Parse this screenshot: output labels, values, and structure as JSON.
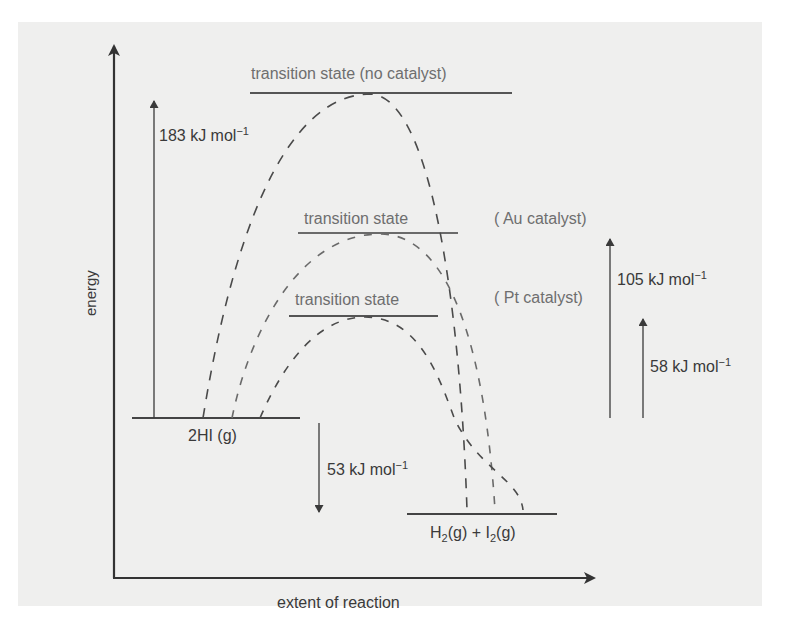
{
  "diagram": {
    "axes": {
      "y_label": "energy",
      "x_label": "extent of reaction"
    },
    "levels": {
      "reactant": {
        "label_main": "2HI",
        "label_state": " (g)"
      },
      "product": {
        "h2": "H",
        "h2_sub": "2",
        "h2_state": "(g) + I",
        "i2_sub": "2",
        "i2_state": "(g)"
      }
    },
    "transition_states": [
      {
        "label": "transition state (no catalyst)",
        "catalyst": "no catalyst"
      },
      {
        "label": "transition state",
        "catalyst_label": "( Au catalyst)"
      },
      {
        "label": "transition state",
        "catalyst_label": "( Pt catalyst)"
      }
    ],
    "energy_arrows": [
      {
        "value": "183 kJ mol",
        "exp": "−1",
        "meaning": "activation energy, no catalyst",
        "direction": "up"
      },
      {
        "value": "53 kJ mol",
        "exp": "−1",
        "meaning": "enthalpy change (exothermic)",
        "direction": "down"
      },
      {
        "value": "105 kJ mol",
        "exp": "−1",
        "meaning": "activation energy, Au catalyst",
        "direction": "up"
      },
      {
        "value": "58 kJ mol",
        "exp": "−1",
        "meaning": "activation energy, Pt catalyst",
        "direction": "up"
      }
    ],
    "colors": {
      "panel_background": "#efefee",
      "page_background": "#ffffff",
      "axis": "#333333",
      "curve_dash": "#4a4a4a",
      "gray_text": "#6e6e6e",
      "dark_text": "#3a3a3a"
    }
  }
}
